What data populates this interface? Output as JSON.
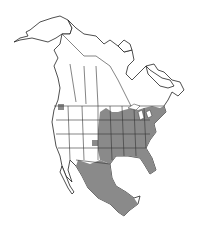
{
  "map": {
    "type": "species-range-map",
    "region": "North America",
    "colors": {
      "background": "#ffffff",
      "land": "#ffffff",
      "outline": "#222222",
      "range": "#8a8a8a"
    },
    "legend": []
  }
}
